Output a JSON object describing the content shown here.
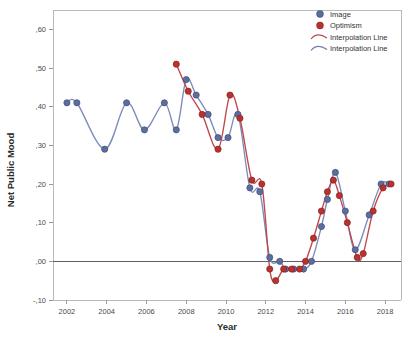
{
  "chart_data": {
    "type": "line",
    "title": "",
    "xlabel": "Year",
    "ylabel": "Net Public Mood",
    "xlim": [
      2001.3,
      2018.8
    ],
    "ylim": [
      -0.1,
      0.65
    ],
    "grid": false,
    "decimal_separator": ",",
    "y_ticks": [
      {
        "value": 0.6,
        "label": ",60"
      },
      {
        "value": 0.5,
        "label": ",50"
      },
      {
        "value": 0.4,
        "label": ",40"
      },
      {
        "value": 0.3,
        "label": ",30"
      },
      {
        "value": 0.2,
        "label": ",20"
      },
      {
        "value": 0.1,
        "label": ",10"
      },
      {
        "value": 0.0,
        "label": ",00"
      },
      {
        "value": -0.1,
        "label": "-,10"
      }
    ],
    "x_ticks": [
      {
        "value": 2002,
        "label": "2002"
      },
      {
        "value": 2004,
        "label": "2004"
      },
      {
        "value": 2006,
        "label": "2006"
      },
      {
        "value": 2008,
        "label": "2008"
      },
      {
        "value": 2010,
        "label": "2010"
      },
      {
        "value": 2012,
        "label": "2012"
      },
      {
        "value": 2014,
        "label": "2014"
      },
      {
        "value": 2016,
        "label": "2016"
      },
      {
        "value": 2018,
        "label": "2018"
      }
    ],
    "zero_reference_line": 0.0,
    "legend_position": "top-right",
    "legend": [
      {
        "label": "Image",
        "marker": "circle",
        "color": "#5d6e9e"
      },
      {
        "label": "Optimism",
        "marker": "circle",
        "color": "#b8322f"
      },
      {
        "label": "Interpolation Line",
        "marker": "curve",
        "color": "#c0474c"
      },
      {
        "label": "Interpolation Line",
        "marker": "curve",
        "color": "#6e7fae"
      }
    ],
    "series": [
      {
        "name": "Image",
        "color": "#5d6e9e",
        "line_color": "#7b8cba",
        "points": [
          {
            "x": 2002.0,
            "y": 0.41
          },
          {
            "x": 2002.5,
            "y": 0.41
          },
          {
            "x": 2003.9,
            "y": 0.29
          },
          {
            "x": 2005.0,
            "y": 0.41
          },
          {
            "x": 2005.9,
            "y": 0.34
          },
          {
            "x": 2006.9,
            "y": 0.41
          },
          {
            "x": 2007.5,
            "y": 0.34
          },
          {
            "x": 2008.0,
            "y": 0.47
          },
          {
            "x": 2008.5,
            "y": 0.43
          },
          {
            "x": 2009.1,
            "y": 0.38
          },
          {
            "x": 2009.6,
            "y": 0.32
          },
          {
            "x": 2010.1,
            "y": 0.32
          },
          {
            "x": 2010.6,
            "y": 0.38
          },
          {
            "x": 2011.2,
            "y": 0.19
          },
          {
            "x": 2011.7,
            "y": 0.18
          },
          {
            "x": 2012.2,
            "y": 0.01
          },
          {
            "x": 2012.7,
            "y": 0.0
          },
          {
            "x": 2013.0,
            "y": -0.02
          },
          {
            "x": 2013.4,
            "y": -0.02
          },
          {
            "x": 2013.9,
            "y": -0.02
          },
          {
            "x": 2014.3,
            "y": 0.0
          },
          {
            "x": 2014.8,
            "y": 0.09
          },
          {
            "x": 2015.1,
            "y": 0.16
          },
          {
            "x": 2015.5,
            "y": 0.23
          },
          {
            "x": 2016.0,
            "y": 0.13
          },
          {
            "x": 2016.5,
            "y": 0.03
          },
          {
            "x": 2017.2,
            "y": 0.12
          },
          {
            "x": 2017.8,
            "y": 0.2
          },
          {
            "x": 2018.2,
            "y": 0.2
          }
        ]
      },
      {
        "name": "Optimism",
        "color": "#b8322f",
        "line_color": "#c0474c",
        "points": [
          {
            "x": 2007.5,
            "y": 0.51
          },
          {
            "x": 2008.1,
            "y": 0.44
          },
          {
            "x": 2008.8,
            "y": 0.38
          },
          {
            "x": 2009.6,
            "y": 0.29
          },
          {
            "x": 2010.2,
            "y": 0.43
          },
          {
            "x": 2010.7,
            "y": 0.37
          },
          {
            "x": 2011.3,
            "y": 0.21
          },
          {
            "x": 2011.8,
            "y": 0.2
          },
          {
            "x": 2012.2,
            "y": -0.02
          },
          {
            "x": 2012.5,
            "y": -0.05
          },
          {
            "x": 2012.9,
            "y": -0.02
          },
          {
            "x": 2013.3,
            "y": -0.02
          },
          {
            "x": 2013.7,
            "y": -0.02
          },
          {
            "x": 2014.0,
            "y": 0.0
          },
          {
            "x": 2014.4,
            "y": 0.06
          },
          {
            "x": 2014.8,
            "y": 0.13
          },
          {
            "x": 2015.1,
            "y": 0.18
          },
          {
            "x": 2015.4,
            "y": 0.21
          },
          {
            "x": 2015.7,
            "y": 0.17
          },
          {
            "x": 2016.1,
            "y": 0.1
          },
          {
            "x": 2016.6,
            "y": 0.01
          },
          {
            "x": 2016.9,
            "y": 0.02
          },
          {
            "x": 2017.4,
            "y": 0.13
          },
          {
            "x": 2017.9,
            "y": 0.19
          },
          {
            "x": 2018.3,
            "y": 0.2
          }
        ]
      }
    ]
  },
  "plot": {
    "left": 53,
    "right": 401,
    "top": 10,
    "bottom": 300
  }
}
